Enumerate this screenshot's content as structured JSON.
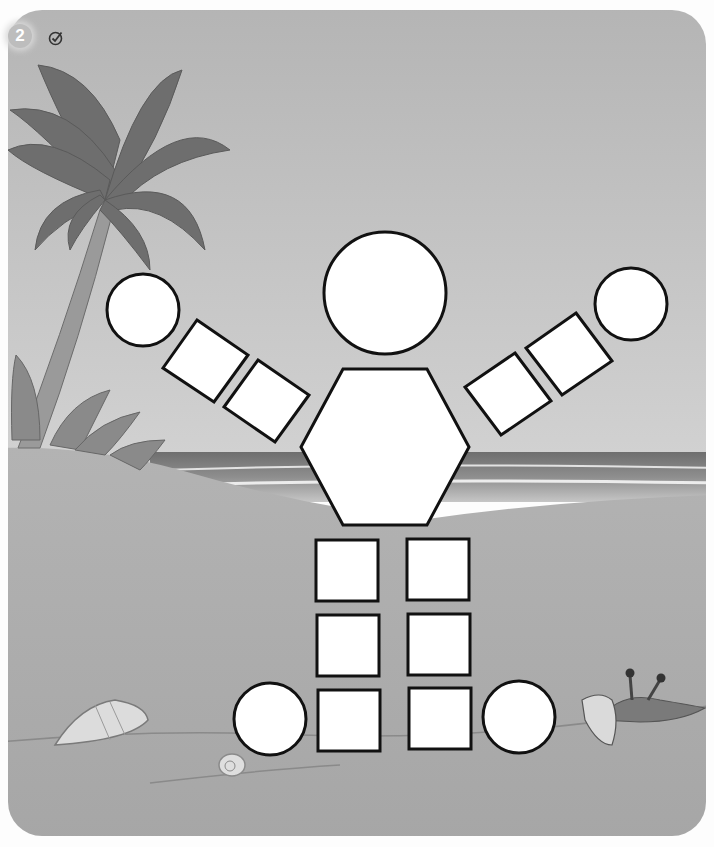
{
  "exercise": {
    "number": "2",
    "icon": "checkmark-pencil-icon"
  },
  "scene": {
    "background": "beach",
    "elements": [
      "palm-tree",
      "ocean",
      "sand",
      "conch-shell",
      "snail-shell",
      "crab"
    ]
  },
  "figure": {
    "name": "shape-robot",
    "shapes": [
      {
        "id": "head",
        "type": "circle",
        "cx": 385,
        "cy": 293,
        "r": 61
      },
      {
        "id": "body",
        "type": "hexagon"
      },
      {
        "id": "left-hand",
        "type": "circle",
        "cx": 143,
        "cy": 310,
        "r": 36
      },
      {
        "id": "right-hand",
        "type": "circle",
        "cx": 631,
        "cy": 304,
        "r": 36
      },
      {
        "id": "left-arm-upper",
        "type": "square"
      },
      {
        "id": "left-arm-lower",
        "type": "square"
      },
      {
        "id": "right-arm-upper",
        "type": "square"
      },
      {
        "id": "right-arm-lower",
        "type": "square"
      },
      {
        "id": "left-leg-1",
        "type": "square"
      },
      {
        "id": "left-leg-2",
        "type": "square"
      },
      {
        "id": "left-leg-3",
        "type": "square"
      },
      {
        "id": "right-leg-1",
        "type": "square"
      },
      {
        "id": "right-leg-2",
        "type": "square"
      },
      {
        "id": "right-leg-3",
        "type": "square"
      },
      {
        "id": "left-foot",
        "type": "circle",
        "cx": 270,
        "cy": 719,
        "r": 36
      },
      {
        "id": "right-foot",
        "type": "circle",
        "cx": 519,
        "cy": 717,
        "r": 36
      }
    ],
    "counts": {
      "circles": 5,
      "squares": 10,
      "hexagons": 1
    }
  },
  "colors": {
    "sky": "#bdbdbd",
    "sand": "#a9a9a9",
    "ocean": "#7d7d7d",
    "shape_fill": "#ffffff",
    "shape_stroke": "#111111",
    "palm": "#6f6f6f"
  }
}
